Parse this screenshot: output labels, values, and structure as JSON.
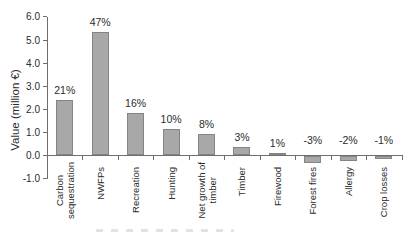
{
  "figure": {
    "background_color": "#ffffff"
  },
  "chart_data": {
    "type": "bar",
    "title": "",
    "xlabel": "",
    "ylabel": "Value (million €)",
    "ylim": [
      -1.0,
      6.0
    ],
    "ytick_step": 1.0,
    "yticks": [
      "6.0",
      "5.0",
      "4.0",
      "3.0",
      "2.0",
      "1.0",
      "0.0",
      "-1.0"
    ],
    "grid": false,
    "legend": "none",
    "bar_color": "#a8a8a8",
    "bar_border_color": "#848484",
    "axis_color": "#6e6e6e",
    "text_color": "#2b2b2b",
    "categories": [
      "Carbon sequestration",
      "NWFPs",
      "Recreation",
      "Hunting",
      "Net growth of timber",
      "Timber",
      "Firewood",
      "Forest fires",
      "Allergy",
      "Crop losses"
    ],
    "category_label_lines": [
      [
        "Carbon",
        "sequestration"
      ],
      [
        "NWFPs"
      ],
      [
        "Recreation"
      ],
      [
        "Hunting"
      ],
      [
        "Net growth of",
        "timber"
      ],
      [
        "Timber"
      ],
      [
        "Firewood"
      ],
      [
        "Forest fires"
      ],
      [
        "Allergy"
      ],
      [
        "Crop losses"
      ]
    ],
    "values": [
      2.4,
      5.35,
      1.85,
      1.15,
      0.92,
      0.37,
      0.12,
      -0.34,
      -0.25,
      -0.13
    ],
    "bar_labels": [
      "21%",
      "47%",
      "16%",
      "10%",
      "8%",
      "3%",
      "1%",
      "-3%",
      "-2%",
      "-1%"
    ]
  }
}
